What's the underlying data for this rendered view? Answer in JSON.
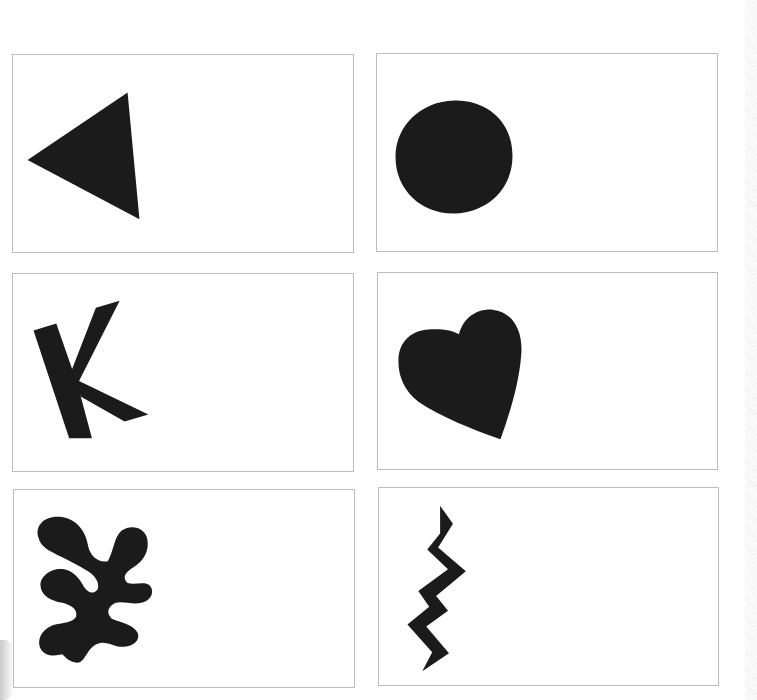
{
  "page": {
    "background": "#ffffff",
    "border_color": "#bdbdbd",
    "shape_color": "#1b1b1b"
  },
  "cards": [
    {
      "id": "triangle",
      "shape": "triangle-icon",
      "row": 1,
      "col": 1
    },
    {
      "id": "circle",
      "shape": "circle-icon",
      "row": 1,
      "col": 2
    },
    {
      "id": "letter-k",
      "shape": "letter-k-icon",
      "row": 2,
      "col": 1
    },
    {
      "id": "heart",
      "shape": "heart-icon",
      "row": 2,
      "col": 2
    },
    {
      "id": "leaf",
      "shape": "leaf-cutout-icon",
      "row": 3,
      "col": 1
    },
    {
      "id": "zigzag",
      "shape": "zigzag-icon",
      "row": 3,
      "col": 2
    }
  ]
}
